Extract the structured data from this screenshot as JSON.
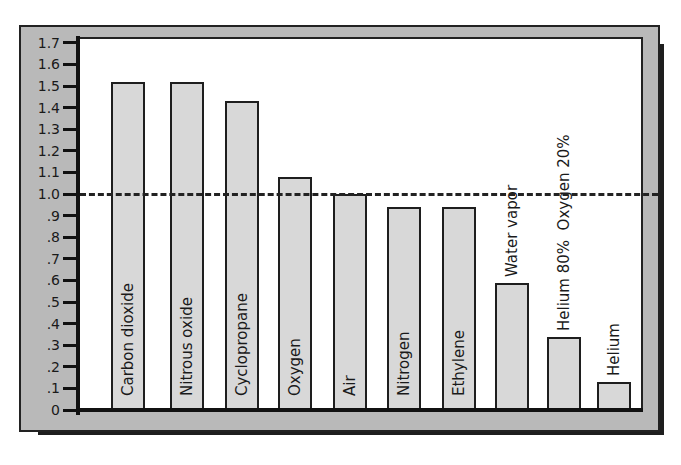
{
  "chart_data": {
    "type": "bar",
    "title": "",
    "xlabel": "",
    "ylabel": "",
    "categories": [
      "Carbon dioxide",
      "Nitrous oxide",
      "Cyclopropane",
      "Oxygen",
      "Air",
      "Nitrogen",
      "Ethylene",
      "Water vapor",
      "Helium 80%  Oxygen 20%",
      "Helium"
    ],
    "values": [
      1.52,
      1.52,
      1.43,
      1.08,
      1.0,
      0.94,
      0.94,
      0.59,
      0.34,
      0.13
    ],
    "ylim": [
      0,
      1.7
    ],
    "yticks": [
      "0",
      ".1",
      ".2",
      ".3",
      ".4",
      ".5",
      ".6",
      ".7",
      ".8",
      ".9",
      "1.0",
      "1.1",
      "1.2",
      "1.3",
      "1.4",
      "1.5",
      "1.6",
      "1.7"
    ],
    "reference_line": {
      "value": 1.0,
      "style": "dashed"
    },
    "grid": false,
    "legend": "none",
    "labels_inside_bars": true,
    "colors": {
      "bar_fill": "#d8d8d8",
      "frame": "#b9b9b9",
      "outline": "#1e1e1e"
    }
  }
}
